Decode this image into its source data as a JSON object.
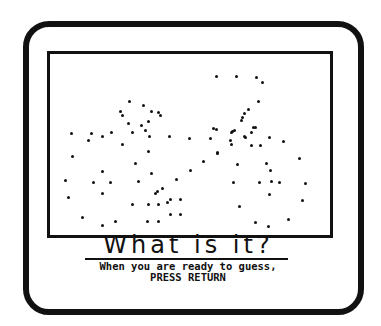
{
  "screen": {
    "title": "What is it?",
    "instruction_line1": "When you are ready to guess,",
    "instruction_line2": "PRESS RETURN"
  },
  "picture": {
    "description": "dot pattern mystery picture",
    "dot_color": "#111111",
    "dot_count": 108
  },
  "colors": {
    "ink": "#111111",
    "background": "#ffffff"
  }
}
